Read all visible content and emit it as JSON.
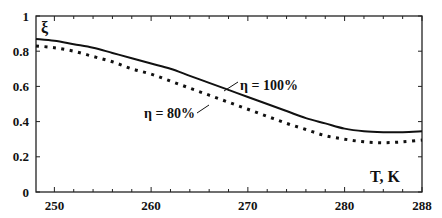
{
  "chart_data": {
    "type": "line",
    "title": "",
    "xlabel": "T, K",
    "ylabel": "ξ",
    "xlim": [
      248.1,
      288
    ],
    "ylim": [
      0,
      1
    ],
    "x_ticks": [
      250,
      260,
      270,
      280,
      288
    ],
    "x_tick_labels": [
      "250",
      "260",
      "270",
      "280",
      "288"
    ],
    "y_ticks": [
      0,
      0.2,
      0.4,
      0.6,
      0.8,
      1
    ],
    "y_tick_labels": [
      "0",
      "0.2",
      "0.4",
      "0.6",
      "0.8",
      "1"
    ],
    "grid": false,
    "legend_position": "inline annotations",
    "series": [
      {
        "name": "η = 100%",
        "style": "solid",
        "x": [
          248.1,
          250,
          252,
          254,
          256,
          258,
          260,
          262,
          264,
          266,
          268,
          270,
          272,
          274,
          276,
          278,
          280,
          282,
          284,
          286,
          288
        ],
        "values": [
          0.87,
          0.86,
          0.84,
          0.82,
          0.79,
          0.76,
          0.73,
          0.7,
          0.66,
          0.62,
          0.58,
          0.54,
          0.5,
          0.46,
          0.42,
          0.39,
          0.36,
          0.345,
          0.34,
          0.34,
          0.345
        ]
      },
      {
        "name": "η = 80%",
        "style": "dotted",
        "x": [
          248.1,
          250,
          252,
          254,
          256,
          258,
          260,
          262,
          264,
          266,
          268,
          270,
          272,
          274,
          276,
          278,
          280,
          282,
          284,
          286,
          288
        ],
        "values": [
          0.83,
          0.82,
          0.8,
          0.77,
          0.74,
          0.7,
          0.67,
          0.63,
          0.59,
          0.55,
          0.51,
          0.47,
          0.43,
          0.39,
          0.355,
          0.32,
          0.3,
          0.285,
          0.28,
          0.285,
          0.295
        ]
      }
    ],
    "annotations": [
      {
        "text": "η = 100%",
        "series": "η = 100%"
      },
      {
        "text": "η = 80%",
        "series": "η = 80%"
      }
    ]
  }
}
